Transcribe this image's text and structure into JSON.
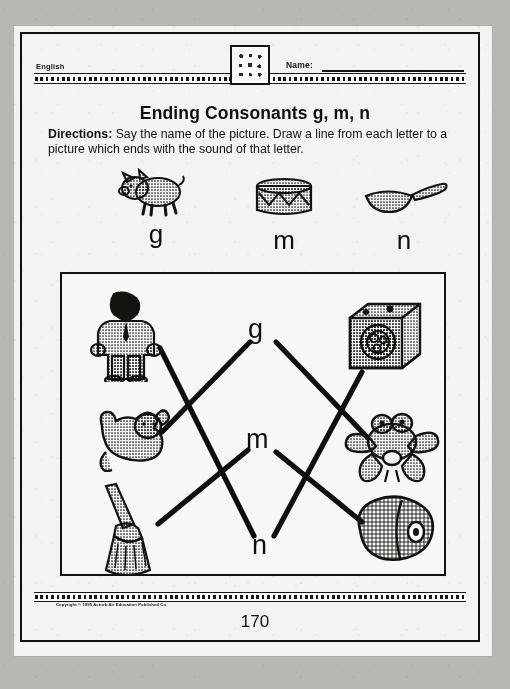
{
  "page": {
    "subject_label": "English",
    "name_label": "Name:",
    "title": "Ending Consonants g, m, n",
    "directions_bold": "Directions:",
    "directions_text": " Say the name of the picture. Draw a line from each letter to a picture which ends with the sound of that letter.",
    "copyright": "Copyright © 1995 Acturb Air Education Published Co.",
    "page_number": "170",
    "emblem_name": "decorative-symbol-tile",
    "ink_color": "#12110f",
    "paper_color": "#f4f3f0",
    "margin_color": "#b9b7b2"
  },
  "examples": [
    {
      "id": "pig",
      "letter": "g",
      "picture": "pig-illustration"
    },
    {
      "id": "drum",
      "letter": "m",
      "picture": "drum-illustration"
    },
    {
      "id": "pan",
      "letter": "n",
      "picture": "pan-illustration"
    }
  ],
  "exercise": {
    "letters": [
      {
        "id": "g",
        "label": "g"
      },
      {
        "id": "m",
        "label": "m"
      },
      {
        "id": "n",
        "label": "n"
      }
    ],
    "left_pictures": [
      {
        "id": "man",
        "picture": "man-illustration",
        "word": "man"
      },
      {
        "id": "dog",
        "picture": "dog-illustration",
        "word": "dog"
      },
      {
        "id": "broom",
        "picture": "broom-illustration",
        "word": "broom"
      }
    ],
    "right_pictures": [
      {
        "id": "drum-washer",
        "picture": "drum-machine-illustration",
        "word": "drum"
      },
      {
        "id": "frog",
        "picture": "frog-illustration",
        "word": "frog"
      },
      {
        "id": "ham",
        "picture": "ham-illustration",
        "word": "ham"
      }
    ],
    "connections": [
      {
        "from": "g",
        "to": "dog"
      },
      {
        "from": "g",
        "to": "frog"
      },
      {
        "from": "m",
        "to": "broom"
      },
      {
        "from": "m",
        "to": "ham"
      },
      {
        "from": "n",
        "to": "man"
      },
      {
        "from": "n",
        "to": "drum-washer"
      }
    ]
  }
}
